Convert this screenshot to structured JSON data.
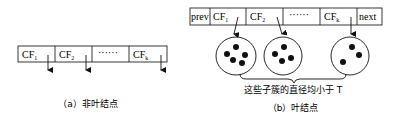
{
  "nonleaf": {
    "cells": [
      {
        "label": "CF",
        "sub": "1"
      },
      {
        "label": "CF",
        "sub": "2"
      },
      {
        "label": "······",
        "sub": ""
      },
      {
        "label": "CF",
        "sub": "k"
      }
    ],
    "caption": "（a）非叶结点"
  },
  "leaf": {
    "prev_label": "prev",
    "next_label": "next",
    "cells": [
      {
        "label": "CF",
        "sub": "1"
      },
      {
        "label": "CF",
        "sub": "2"
      },
      {
        "label": "······",
        "sub": ""
      },
      {
        "label": "CF",
        "sub": "k"
      }
    ],
    "clusters": [
      {
        "points": 5
      },
      {
        "points": 4
      },
      {
        "points": 3
      }
    ],
    "brace_label": "这些子簇的直径均小于 T",
    "caption": "（b）叶结点"
  }
}
